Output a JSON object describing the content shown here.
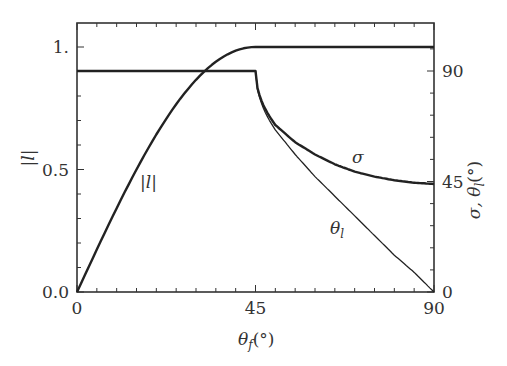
{
  "chart_data": {
    "type": "line",
    "title": "",
    "xlabel": "θ_f(°)",
    "ylabel_left": "|l|",
    "ylabel_right": "σ, θ_l(°)",
    "xlim": [
      0,
      90
    ],
    "ylim_left": [
      0,
      1.1
    ],
    "ylim_right": [
      0,
      99
    ],
    "x_ticks": [
      {
        "value": 0,
        "label": "0"
      },
      {
        "value": 45,
        "label": "45"
      },
      {
        "value": 90,
        "label": "90"
      }
    ],
    "y_left_ticks": [
      {
        "value": 0,
        "label": "0.0"
      },
      {
        "value": 0.5,
        "label": "0.5"
      },
      {
        "value": 1.0,
        "label": "1."
      }
    ],
    "y_right_ticks": [
      {
        "value": 0,
        "label": "0"
      },
      {
        "value": 45,
        "label": "45"
      },
      {
        "value": 90,
        "label": "90"
      }
    ],
    "grid": false,
    "legend": "inline curve labels",
    "x": [
      0,
      5,
      10,
      15,
      20,
      25,
      30,
      35,
      40,
      45,
      50,
      55,
      60,
      65,
      70,
      75,
      80,
      85,
      90
    ],
    "series": [
      {
        "name": "|l|",
        "axis": "left",
        "values": [
          0.0,
          0.174,
          0.342,
          0.5,
          0.643,
          0.766,
          0.866,
          0.94,
          0.985,
          1.0,
          1.0,
          1.0,
          1.0,
          1.0,
          1.0,
          1.0,
          1.0,
          1.0,
          1.0
        ],
        "label_position": {
          "x": 18,
          "y": 0.42
        }
      },
      {
        "name": "σ",
        "axis": "right",
        "values": [
          90,
          90,
          90,
          90,
          90,
          90,
          90,
          90,
          90,
          90,
          68,
          61,
          56,
          52,
          49,
          47,
          45.5,
          44.5,
          44
        ],
        "label_position": {
          "x": 63,
          "y": 52
        }
      },
      {
        "name": "θ_l",
        "axis": "right",
        "values": [
          90,
          90,
          90,
          90,
          90,
          90,
          90,
          90,
          90,
          90,
          66,
          56,
          47,
          39,
          31,
          23,
          15,
          8,
          0
        ],
        "label_position": {
          "x": 60,
          "y": 27
        }
      }
    ]
  },
  "labels": {
    "x_axis": "θ",
    "x_axis_sub": "f",
    "x_axis_unit": "(°)",
    "y_left_axis": "|l|",
    "y_right_axis": "σ, θ",
    "y_right_sub": "l",
    "y_right_unit": "(°)",
    "curve_l": "|l|",
    "curve_sigma": "σ",
    "curve_theta": "θ",
    "curve_theta_sub": "l"
  }
}
